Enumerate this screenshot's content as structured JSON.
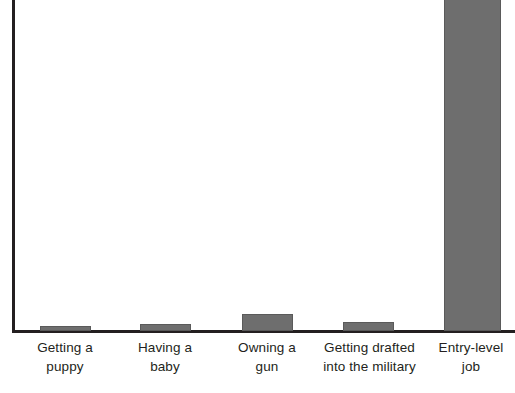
{
  "chart_data": {
    "type": "bar",
    "title": "",
    "subtitle": "",
    "xlabel": "",
    "ylabel": "",
    "categories": [
      "Getting a\npuppy",
      "Having a\nbaby",
      "Owning a\ngun",
      "Getting drafted\ninto the military",
      "Entry-level\njob"
    ],
    "values": [
      1,
      2,
      5,
      3,
      110
    ],
    "ylim": [
      0,
      100
    ],
    "grid": false,
    "legend": null,
    "annotations": [],
    "bar_color": "#6e6e6e",
    "axis_color": "#231f20"
  },
  "axes": {
    "y_axis_name": "y-axis",
    "x_axis_name": "x-axis"
  },
  "bars": [
    {
      "label": "Getting a\npuppy",
      "value": 1,
      "left": 40,
      "width": 51,
      "height": 5
    },
    {
      "label": "Having a\nbaby",
      "value": 2,
      "left": 140,
      "width": 51,
      "height": 7
    },
    {
      "label": "Owning a\ngun",
      "value": 5,
      "left": 242,
      "width": 51,
      "height": 17
    },
    {
      "label": "Getting drafted\ninto the military",
      "value": 3,
      "left": 343,
      "width": 51,
      "height": 9
    },
    {
      "label": "Entry-level\njob",
      "value": 110,
      "left": 444,
      "width": 57,
      "height": 336
    }
  ],
  "labels": [
    {
      "text": "Getting a\npuppy",
      "left": 15,
      "width": 100
    },
    {
      "text": "Having a\nbaby",
      "left": 115,
      "width": 100
    },
    {
      "text": "Owning a\ngun",
      "left": 217,
      "width": 100
    },
    {
      "text": "Getting drafted\ninto the military",
      "left": 318,
      "width": 103
    },
    {
      "text": "Entry-level\njob",
      "left": 427,
      "width": 88
    }
  ]
}
